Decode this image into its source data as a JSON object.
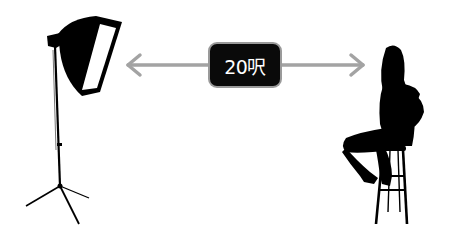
{
  "diagram": {
    "distance_label": "20呎",
    "left_object": "softbox-light-on-stand",
    "right_object": "woman-silhouette-on-stool",
    "arrow": "double-headed-arrow",
    "colors": {
      "arrow": "#a3a3a3",
      "badge_bg": "#0a0a0a",
      "badge_text": "#ffffff",
      "silhouette": "#000000",
      "background": "#ffffff"
    }
  }
}
